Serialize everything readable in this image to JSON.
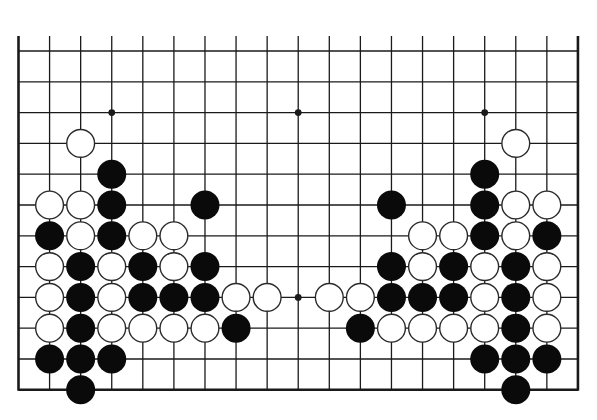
{
  "diagram": {
    "type": "go-board-partial",
    "board_size": 19,
    "visible_rows": 12,
    "edges_visible": [
      "left",
      "right",
      "bottom"
    ],
    "colors": {
      "line": "#1a1a1a",
      "black_stone": "#0a0a0a",
      "white_stone": "#ffffff",
      "white_outline": "#2a2a2a",
      "background": "#ffffff"
    },
    "geometry": {
      "x0": 18.5,
      "dx": 31.08,
      "y0": 51,
      "dy": 30.8,
      "top_overhang": 15,
      "stone_radius": 14.5
    },
    "star_points": [
      [
        3,
        2
      ],
      [
        9,
        2
      ],
      [
        15,
        2
      ],
      [
        9,
        8
      ]
    ],
    "stones": {
      "black": [
        [
          3,
          4
        ],
        [
          3,
          5
        ],
        [
          6,
          5
        ],
        [
          1,
          6
        ],
        [
          3,
          6
        ],
        [
          2,
          7
        ],
        [
          4,
          7
        ],
        [
          6,
          7
        ],
        [
          2,
          8
        ],
        [
          4,
          8
        ],
        [
          5,
          8
        ],
        [
          6,
          8
        ],
        [
          2,
          9
        ],
        [
          7,
          9
        ],
        [
          1,
          10
        ],
        [
          2,
          10
        ],
        [
          3,
          10
        ],
        [
          2,
          11
        ],
        [
          15,
          4
        ],
        [
          12,
          5
        ],
        [
          15,
          5
        ],
        [
          15,
          6
        ],
        [
          17,
          6
        ],
        [
          12,
          7
        ],
        [
          14,
          7
        ],
        [
          16,
          7
        ],
        [
          12,
          8
        ],
        [
          13,
          8
        ],
        [
          14,
          8
        ],
        [
          16,
          8
        ],
        [
          11,
          9
        ],
        [
          16,
          9
        ],
        [
          15,
          10
        ],
        [
          16,
          10
        ],
        [
          17,
          10
        ],
        [
          16,
          11
        ]
      ],
      "white": [
        [
          2,
          3
        ],
        [
          1,
          5
        ],
        [
          2,
          5
        ],
        [
          2,
          6
        ],
        [
          4,
          6
        ],
        [
          5,
          6
        ],
        [
          1,
          7
        ],
        [
          3,
          7
        ],
        [
          5,
          7
        ],
        [
          1,
          8
        ],
        [
          3,
          8
        ],
        [
          7,
          8
        ],
        [
          8,
          8
        ],
        [
          1,
          9
        ],
        [
          3,
          9
        ],
        [
          4,
          9
        ],
        [
          5,
          9
        ],
        [
          6,
          9
        ],
        [
          16,
          3
        ],
        [
          16,
          5
        ],
        [
          17,
          5
        ],
        [
          13,
          6
        ],
        [
          14,
          6
        ],
        [
          16,
          6
        ],
        [
          13,
          7
        ],
        [
          15,
          7
        ],
        [
          17,
          7
        ],
        [
          10,
          8
        ],
        [
          11,
          8
        ],
        [
          15,
          8
        ],
        [
          17,
          8
        ],
        [
          12,
          9
        ],
        [
          13,
          9
        ],
        [
          14,
          9
        ],
        [
          15,
          9
        ],
        [
          17,
          9
        ]
      ]
    }
  }
}
